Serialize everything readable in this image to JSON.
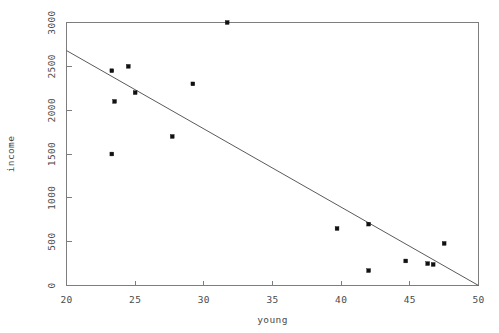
{
  "chart_data": {
    "type": "scatter",
    "title": "",
    "xlabel": "young",
    "ylabel": "income",
    "xlim": [
      20,
      50
    ],
    "ylim": [
      0,
      3000
    ],
    "grid": false,
    "legend": null,
    "x_ticks": [
      20,
      25,
      30,
      35,
      40,
      45,
      50
    ],
    "x_tick_labels": [
      "20",
      "25",
      "30",
      "35",
      "40",
      "45",
      "50"
    ],
    "y_ticks": [
      0,
      500,
      1000,
      1500,
      2000,
      2500,
      3000
    ],
    "y_tick_labels": [
      "0",
      "500",
      "1000",
      "1500",
      "2000",
      "2500",
      "3000"
    ],
    "points": [
      {
        "x": 23.3,
        "y": 1500
      },
      {
        "x": 23.3,
        "y": 2450
      },
      {
        "x": 23.5,
        "y": 2100
      },
      {
        "x": 24.5,
        "y": 2500
      },
      {
        "x": 25.0,
        "y": 2200
      },
      {
        "x": 27.7,
        "y": 1700
      },
      {
        "x": 29.2,
        "y": 2300
      },
      {
        "x": 31.7,
        "y": 3000
      },
      {
        "x": 39.7,
        "y": 650
      },
      {
        "x": 42.0,
        "y": 700
      },
      {
        "x": 42.0,
        "y": 170
      },
      {
        "x": 44.7,
        "y": 280
      },
      {
        "x": 46.3,
        "y": 250
      },
      {
        "x": 46.7,
        "y": 240
      },
      {
        "x": 47.5,
        "y": 480
      }
    ],
    "fit_line": {
      "name": "regression-line",
      "x_start": 20,
      "y_start": 2680,
      "x_end": 50,
      "y_end": 0
    },
    "colors": {
      "point": "#111111",
      "line": "#5a5a5a",
      "axis": "#7d7d7d",
      "text": "#4a4a4a",
      "background": "#ffffff"
    }
  }
}
